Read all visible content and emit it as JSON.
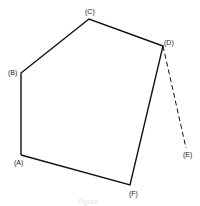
{
  "diagram": {
    "type": "polygon-with-dashed-segment",
    "vertices": {
      "A": {
        "label": "(A)",
        "x": 21,
        "y": 155,
        "lx": 14,
        "ly": 165
      },
      "B": {
        "label": "(B)",
        "x": 21,
        "y": 73,
        "lx": 8,
        "ly": 75
      },
      "C": {
        "label": "(C)",
        "x": 89,
        "y": 19,
        "lx": 86,
        "ly": 14
      },
      "D": {
        "label": "(D)",
        "x": 163,
        "y": 46,
        "lx": 165,
        "ly": 45
      },
      "E": {
        "label": "(E)",
        "x": 186,
        "y": 148,
        "lx": 184,
        "ly": 157
      },
      "F": {
        "label": "(F)",
        "x": 130,
        "y": 185,
        "lx": 130,
        "ly": 196
      }
    },
    "solid_edges": [
      [
        "A",
        "B"
      ],
      [
        "B",
        "C"
      ],
      [
        "C",
        "D"
      ],
      [
        "D",
        "F"
      ],
      [
        "F",
        "A"
      ]
    ],
    "dashed_edges": [
      [
        "D",
        "E"
      ]
    ],
    "caption": "Figure"
  },
  "colors": {
    "line": "#111111",
    "label": "#222222",
    "background": "#ffffff"
  }
}
